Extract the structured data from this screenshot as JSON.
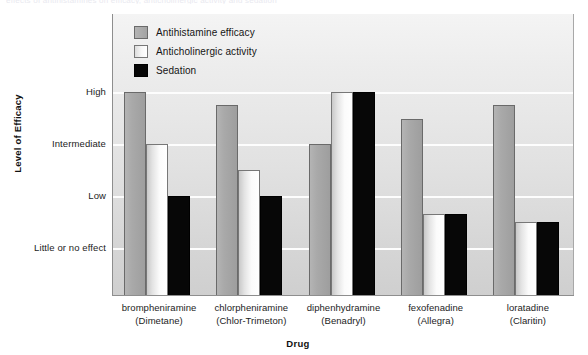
{
  "caption_remnant": "effects of antihistamines on efficacy, anticholinergic activity and sedation",
  "chart_data": {
    "type": "bar",
    "title": "",
    "xlabel": "Drug",
    "ylabel": "Level of Efficacy",
    "grid": true,
    "legend_position": "top-left-inside",
    "ytick_labels": [
      "Little or no effect",
      "Low",
      "Intermediate",
      "High"
    ],
    "ytick_values": [
      1,
      2,
      3,
      4
    ],
    "ylim": [
      0,
      4.6
    ],
    "categories": [
      "brompheniramine",
      "chlorpheniramine",
      "diphenhydramine",
      "fexofenadine",
      "loratadine"
    ],
    "category_brands": [
      "(Dimetane)",
      "(Chlor-Trimeton)",
      "(Benadryl)",
      "(Allegra)",
      "(Claritin)"
    ],
    "series": [
      {
        "name": "Antihistamine efficacy",
        "key": "efficacy",
        "color": "#a9a9a9",
        "values": [
          4.0,
          3.75,
          3.0,
          3.48,
          3.75
        ],
        "value_labels": [
          "High",
          "High / Intermediate",
          "Intermediate",
          "High / Intermediate",
          "High / Intermediate"
        ]
      },
      {
        "name": "Anticholinergic activity",
        "key": "anticholinergic",
        "color": "#ffffff",
        "values": [
          3.0,
          2.5,
          4.0,
          1.65,
          1.5
        ],
        "value_labels": [
          "Intermediate",
          "Intermediate / Low",
          "High",
          "Low / Little or no effect",
          "Low / Little or no effect"
        ]
      },
      {
        "name": "Sedation",
        "key": "sedation",
        "color": "#070707",
        "values": [
          2.0,
          2.0,
          4.0,
          1.65,
          1.5
        ],
        "value_labels": [
          "Low",
          "Low",
          "High",
          "Low / Little or no effect",
          "Low / Little or no effect"
        ]
      }
    ]
  },
  "legend": {
    "items": [
      {
        "label": "Antihistamine efficacy",
        "key": "efficacy"
      },
      {
        "label": "Anticholinergic activity",
        "key": "anticholinergic"
      },
      {
        "label": "Sedation",
        "key": "sedation"
      }
    ]
  },
  "axes": {
    "x_title": "Drug",
    "y_title": "Level of Efficacy"
  }
}
